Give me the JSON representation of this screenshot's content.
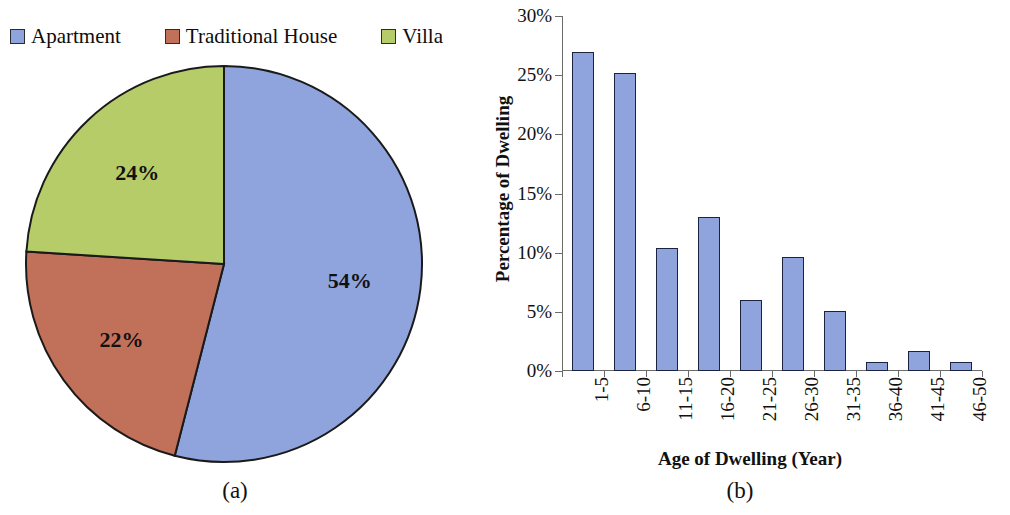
{
  "figure": {
    "panel_a_caption": "(a)",
    "panel_b_caption": "(b)"
  },
  "legend": {
    "items": [
      {
        "label": "Apartment",
        "color": "#8fa3dc"
      },
      {
        "label": "Traditional House",
        "color": "#c1705a"
      },
      {
        "label": "Villa",
        "color": "#b5cc68"
      }
    ]
  },
  "chart_data": [
    {
      "type": "pie",
      "title": "",
      "labels": [
        "Apartment",
        "Traditional House",
        "Villa"
      ],
      "values": [
        54,
        22,
        24
      ],
      "data_labels": [
        "54%",
        "22%",
        "24%"
      ],
      "colors": [
        "#8fa3dc",
        "#c1705a",
        "#b5cc68"
      ],
      "legend_position": "top",
      "start_angle_deg": -90,
      "direction": "clockwise"
    },
    {
      "type": "bar",
      "title": "",
      "categories": [
        "1-5",
        "6-10",
        "11-15",
        "16-20",
        "21-25",
        "26-30",
        "31-35",
        "36-40",
        "41-45",
        "46-50"
      ],
      "values": [
        27.0,
        25.2,
        10.4,
        13.0,
        6.0,
        9.6,
        5.1,
        0.8,
        1.7,
        0.8
      ],
      "series": [
        {
          "name": "Percentage of Dwelling",
          "values": [
            27.0,
            25.2,
            10.4,
            13.0,
            6.0,
            9.6,
            5.1,
            0.8,
            1.7,
            0.8
          ]
        }
      ],
      "xlabel": "Age of Dwelling (Year)",
      "ylabel": "Percentage of Dwelling",
      "ylim": [
        0,
        30
      ],
      "ytick_values": [
        0,
        5,
        10,
        15,
        20,
        25,
        30
      ],
      "ytick_labels": [
        "0%",
        "5%",
        "10%",
        "15%",
        "20%",
        "25%",
        "30%"
      ],
      "grid": false,
      "legend_position": "none",
      "bar_color": "#8fa3dc",
      "bar_edge_color": "#1c2340"
    }
  ]
}
